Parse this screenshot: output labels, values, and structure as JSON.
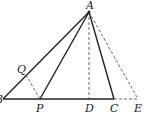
{
  "diagram": {
    "type": "geometry-triangle",
    "points": {
      "A": {
        "label": "A",
        "x": 89,
        "y": 12
      },
      "B": {
        "label": "B",
        "x": 3,
        "y": 99
      },
      "P": {
        "label": "P",
        "x": 40,
        "y": 99
      },
      "D": {
        "label": "D",
        "x": 89,
        "y": 99
      },
      "C": {
        "label": "C",
        "x": 114,
        "y": 99
      },
      "E": {
        "label": "E",
        "x": 138,
        "y": 99
      },
      "Q": {
        "label": "Q",
        "x": 26,
        "y": 75
      }
    },
    "solid_segments": [
      "AB",
      "AP",
      "AC",
      "BC"
    ],
    "dashed_segments": [
      "AD",
      "AE",
      "PQ",
      "CE"
    ],
    "line_color": "#222222"
  }
}
